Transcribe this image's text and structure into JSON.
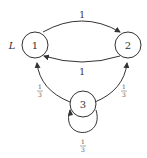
{
  "diagram": {
    "type": "state-transition-graph",
    "side_label": "L",
    "nodes": [
      {
        "id": "1",
        "label": "1"
      },
      {
        "id": "2",
        "label": "2"
      },
      {
        "id": "3",
        "label": "3"
      }
    ],
    "edges": [
      {
        "from": "1",
        "to": "2",
        "label": "1",
        "num": "",
        "den": ""
      },
      {
        "from": "2",
        "to": "1",
        "label": "1",
        "num": "",
        "den": ""
      },
      {
        "from": "3",
        "to": "1",
        "label": "1/3",
        "num": "1",
        "den": "3"
      },
      {
        "from": "3",
        "to": "2",
        "label": "1/3",
        "num": "1",
        "den": "3"
      },
      {
        "from": "3",
        "to": "3",
        "label": "1/3",
        "num": "1",
        "den": "3"
      }
    ]
  },
  "colors": {
    "stroke": "#333333",
    "background": "#ffffff"
  }
}
